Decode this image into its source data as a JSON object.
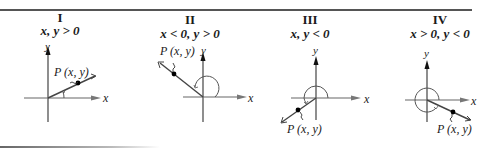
{
  "figure": {
    "panels": [
      {
        "numeral": "I",
        "condition": "x, y > 0",
        "point_label": "P (x, y)",
        "x_axis_label": "x",
        "y_axis_label": "y"
      },
      {
        "numeral": "II",
        "condition": "x < 0, y > 0",
        "point_label": "P (x, y)",
        "x_axis_label": "x",
        "y_axis_label": "y"
      },
      {
        "numeral": "III",
        "condition": "x, y < 0",
        "point_label": "P (x, y)",
        "x_axis_label": "x",
        "y_axis_label": "y"
      },
      {
        "numeral": "IV",
        "condition": "x > 0, y < 0",
        "point_label": "P (x, y)",
        "x_axis_label": "x",
        "y_axis_label": "y"
      }
    ]
  }
}
